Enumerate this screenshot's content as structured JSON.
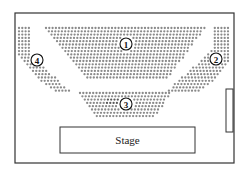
{
  "diagram": {
    "type": "seating-chart",
    "sections": [
      {
        "id": "1",
        "label": "1",
        "position": "center-rear"
      },
      {
        "id": "2",
        "label": "2",
        "position": "right"
      },
      {
        "id": "3",
        "label": "3",
        "position": "center-front"
      },
      {
        "id": "4",
        "label": "4",
        "position": "left"
      }
    ],
    "stage": {
      "label": "Stage"
    },
    "door": {
      "position": "right-wall"
    },
    "colors": {
      "seat": "#8a8a8a",
      "outline": "#333333",
      "background": "#ffffff"
    }
  }
}
